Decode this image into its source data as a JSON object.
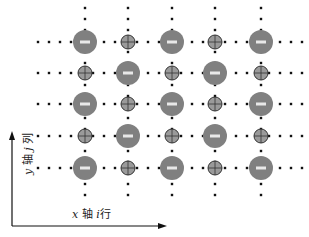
{
  "diagram": {
    "type": "ionic-lattice",
    "grid": {
      "columns_x": [
        85,
        128,
        172,
        215,
        261
      ],
      "rows_y": [
        42,
        73,
        104,
        136,
        168
      ],
      "h_line_extent": [
        38,
        306
      ],
      "v_line_extent": [
        8,
        202
      ],
      "dot_spacing": 11
    },
    "lattice": [
      [
        "anion",
        "cation",
        "anion",
        "cation",
        "anion"
      ],
      [
        "cation",
        "anion",
        "cation",
        "anion",
        "cation"
      ],
      [
        "anion",
        "cation",
        "anion",
        "cation",
        "anion"
      ],
      [
        "cation",
        "anion",
        "cation",
        "anion",
        "cation"
      ],
      [
        "anion",
        "cation",
        "anion",
        "cation",
        "anion"
      ]
    ],
    "species": {
      "anion": {
        "symbol": "minus",
        "radius": 12,
        "fill": "#808080",
        "mark": "#e8e8e8"
      },
      "cation": {
        "symbol": "plus",
        "radius": 7,
        "fill": "#9a9a9a",
        "stroke": "#333333"
      }
    },
    "colors": {
      "dots": "#111111",
      "axis": "#111111"
    }
  },
  "axes": {
    "x_label": {
      "var": "x",
      "axis_word": "轴",
      "index": "i",
      "index_word": "行"
    },
    "y_label": {
      "var": "y",
      "axis_word": "轴",
      "index": "j",
      "index_word": "列"
    }
  }
}
